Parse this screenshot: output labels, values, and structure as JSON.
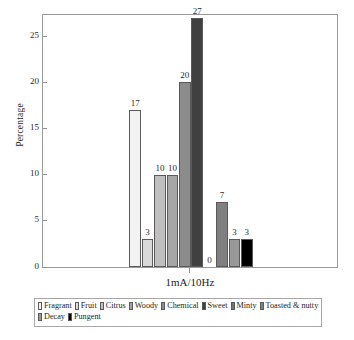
{
  "chart_data": {
    "type": "bar",
    "title": "",
    "subtitle": "",
    "xlabel": "1mA/10Hz",
    "ylabel": "Percentage",
    "categories": [
      "Fragrant",
      "Fruit",
      "Citrus",
      "Woody",
      "Chemical",
      "Sweet",
      "Minty",
      "Toasted & nutty",
      "Decay",
      "Pungent"
    ],
    "values": [
      17,
      3,
      10,
      10,
      20,
      27,
      0,
      7,
      3,
      3
    ],
    "value_labels": [
      "17",
      "3",
      "10",
      "10",
      "20",
      "27",
      "0",
      "7",
      "3",
      "3"
    ],
    "colors": [
      "#f2f2f2",
      "#d9d9d9",
      "#bfbfbf",
      "#a6a6a6",
      "#8c8c8c",
      "#404040",
      "#ffffff",
      "#808080",
      "#999999",
      "#000000"
    ],
    "ylim": [
      0,
      27.5
    ],
    "yticks": [
      0,
      5,
      10,
      15,
      20,
      25
    ],
    "ytick_labels": [
      "0",
      "5",
      "10",
      "15",
      "20",
      "25"
    ],
    "xticks": [
      "1mA/10Hz"
    ],
    "grid": false,
    "legend_position": "bottom",
    "legend_rows": [
      [
        {
          "label": "Fragrant",
          "color": "#f2f2f2"
        },
        {
          "label": "Fruit",
          "color": "#d9d9d9"
        },
        {
          "label": "Citrus",
          "color": "#bfbfbf"
        },
        {
          "label": "Woody",
          "color": "#a6a6a6"
        },
        {
          "label": "Chemical",
          "color": "#8c8c8c"
        },
        {
          "label": "Sweet",
          "color": "#404040"
        },
        {
          "label": "Minty",
          "color": "#737373"
        },
        {
          "label": "Toasted & nutty",
          "color": "#808080"
        }
      ],
      [
        {
          "label": "Decay",
          "color": "#999999"
        },
        {
          "label": "Pungent",
          "color": "#000000"
        }
      ]
    ]
  }
}
